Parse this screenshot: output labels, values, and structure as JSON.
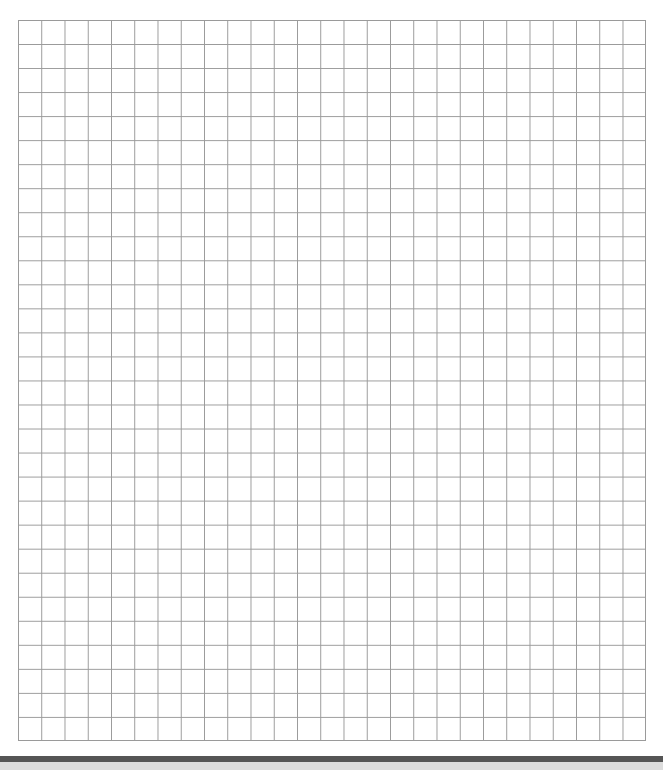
{
  "grid": {
    "columns": 27,
    "rows": 30,
    "line_color": "#9a9a9a",
    "background": "#ffffff"
  },
  "footer": {
    "bar_color": "#555555",
    "strip_color": "#dcdcdc"
  }
}
